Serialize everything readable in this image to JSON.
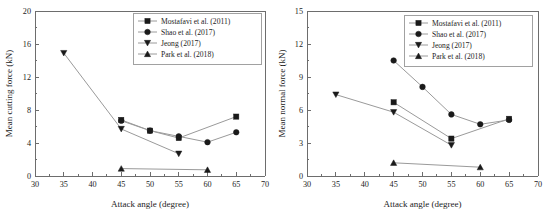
{
  "figure": {
    "background": "#ffffff",
    "line_color": "#9a9a9a",
    "marker_color": "#1a1a1a",
    "axis_color": "#6d6d6d"
  },
  "chart_data": [
    {
      "type": "line",
      "panel": "left",
      "title": "",
      "xlabel": "Attack angle (degree)",
      "ylabel": "Mean cutting force (kN)",
      "xlim": [
        30,
        70
      ],
      "ylim": [
        0,
        20
      ],
      "xticks": [
        30,
        35,
        40,
        45,
        50,
        55,
        60,
        65,
        70
      ],
      "xtick_labels": [
        "30",
        "35",
        "40",
        "45",
        "50",
        "55",
        "60",
        "65",
        "70"
      ],
      "yticks": [
        0,
        4,
        8,
        12,
        16,
        20
      ],
      "ytick_labels": [
        "0",
        "4",
        "8",
        "12",
        "16",
        "20"
      ],
      "minor_xticks": [
        32.5,
        37.5,
        42.5,
        47.5,
        52.5,
        57.5,
        62.5,
        67.5
      ],
      "minor_yticks": [
        2,
        6,
        10,
        14,
        18
      ],
      "grid": false,
      "legend_position": "upper right",
      "series": [
        {
          "name": "Mostafavi et al. (2011)",
          "marker": "square",
          "x": [
            45,
            50,
            55,
            65
          ],
          "values": [
            6.8,
            5.5,
            4.6,
            7.2
          ]
        },
        {
          "name": "Shao et al. (2017)",
          "marker": "circle",
          "x": [
            45,
            50,
            55,
            60,
            65
          ],
          "values": [
            6.7,
            5.5,
            4.8,
            4.1,
            5.3
          ]
        },
        {
          "name": "Jeong (2017)",
          "marker": "triangle-down",
          "x": [
            35,
            45,
            55
          ],
          "values": [
            14.9,
            5.7,
            2.7
          ]
        },
        {
          "name": "Park et al. (2018)",
          "marker": "triangle-up",
          "x": [
            45,
            60
          ],
          "values": [
            0.9,
            0.75
          ]
        }
      ]
    },
    {
      "type": "line",
      "panel": "right",
      "title": "",
      "xlabel": "Attack angle (degree)",
      "ylabel": "Mean normal force (kN)",
      "xlim": [
        30,
        70
      ],
      "ylim": [
        0,
        15
      ],
      "xticks": [
        30,
        35,
        40,
        45,
        50,
        55,
        60,
        65,
        70
      ],
      "xtick_labels": [
        "30",
        "35",
        "40",
        "45",
        "50",
        "55",
        "60",
        "65",
        "70"
      ],
      "yticks": [
        0,
        3,
        6,
        9,
        12,
        15
      ],
      "ytick_labels": [
        "0",
        "3",
        "6",
        "9",
        "12",
        "15"
      ],
      "minor_xticks": [
        32.5,
        37.5,
        42.5,
        47.5,
        52.5,
        57.5,
        62.5,
        67.5
      ],
      "minor_yticks": [
        1.5,
        4.5,
        7.5,
        10.5,
        13.5
      ],
      "grid": false,
      "legend_position": "upper right",
      "series": [
        {
          "name": "Mostafavi et al. (2011)",
          "marker": "square",
          "x": [
            45,
            55,
            65
          ],
          "values": [
            6.7,
            3.4,
            5.2
          ]
        },
        {
          "name": "Shao et al. (2017)",
          "marker": "circle",
          "x": [
            45,
            50,
            55,
            60,
            65
          ],
          "values": [
            10.5,
            8.1,
            5.6,
            4.7,
            5.1
          ]
        },
        {
          "name": "Jeong (2017)",
          "marker": "triangle-down",
          "x": [
            35,
            45,
            55
          ],
          "values": [
            7.4,
            5.8,
            2.8
          ]
        },
        {
          "name": "Park et al. (2018)",
          "marker": "triangle-up",
          "x": [
            45,
            60
          ],
          "values": [
            1.2,
            0.8
          ]
        }
      ]
    }
  ]
}
